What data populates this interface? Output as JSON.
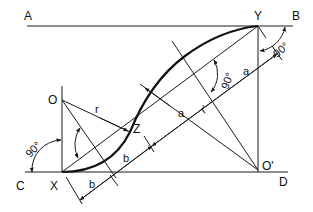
{
  "diagram": {
    "points": {
      "A": "A",
      "B": "B",
      "C": "C",
      "D": "D",
      "X": "X",
      "Y": "Y",
      "Z": "Z",
      "O": "O",
      "O_prime": "O'"
    },
    "dimensions": {
      "a_upper": "a",
      "a_lower": "a",
      "b_upper": "b",
      "b_lower": "b",
      "r": "r",
      "r_prime": "r'"
    },
    "angles": {
      "angle_left": "90°",
      "angle_O": "90°",
      "angle_mid": "90°",
      "angle_right": "90°"
    },
    "colors": {
      "stroke": "#1a1a1a",
      "background": "#ffffff"
    }
  }
}
